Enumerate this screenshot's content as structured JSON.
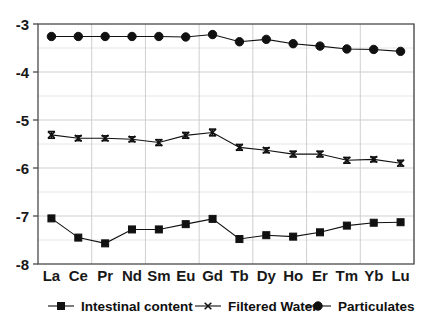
{
  "chart_data": {
    "type": "line",
    "title": "",
    "subtitle": "",
    "xlabel": "",
    "ylabel": "",
    "categories": [
      "La",
      "Ce",
      "Pr",
      "Nd",
      "Sm",
      "Eu",
      "Gd",
      "Tb",
      "Dy",
      "Ho",
      "Er",
      "Tm",
      "Yb",
      "Lu"
    ],
    "ylim": [
      -8,
      -3
    ],
    "yticks": [
      -3,
      -4,
      -5,
      -6,
      -7,
      -8
    ],
    "ytick_labels": [
      "-3",
      "-4",
      "-5",
      "-6",
      "-7",
      "-8"
    ],
    "grid": true,
    "legend_position": "bottom",
    "series": [
      {
        "name": "Intestinal content",
        "marker": "square",
        "color": "#111111",
        "values": [
          -7.05,
          -7.45,
          -7.57,
          -7.28,
          -7.28,
          -7.17,
          -7.06,
          -7.48,
          -7.4,
          -7.43,
          -7.34,
          -7.2,
          -7.14,
          -7.13
        ],
        "errors": [
          0,
          0,
          0,
          0,
          0,
          0,
          0,
          0,
          0,
          0,
          0,
          0,
          0,
          0
        ]
      },
      {
        "name": "Filtered Water",
        "marker": "x-errorbar",
        "color": "#111111",
        "values": [
          -5.31,
          -5.38,
          -5.38,
          -5.4,
          -5.47,
          -5.32,
          -5.26,
          -5.57,
          -5.63,
          -5.71,
          -5.71,
          -5.84,
          -5.82,
          -5.9
        ],
        "errors": [
          0.07,
          0.05,
          0.05,
          0.05,
          0.06,
          0.06,
          0.07,
          0.06,
          0.05,
          0.06,
          0.06,
          0.06,
          0.05,
          0.06
        ]
      },
      {
        "name": "Particulates",
        "marker": "circle",
        "color": "#111111",
        "values": [
          -3.26,
          -3.26,
          -3.26,
          -3.26,
          -3.26,
          -3.27,
          -3.22,
          -3.37,
          -3.32,
          -3.41,
          -3.46,
          -3.52,
          -3.53,
          -3.57
        ],
        "errors": [
          0,
          0,
          0,
          0,
          0,
          0,
          0,
          0,
          0,
          0,
          0,
          0,
          0,
          0
        ]
      }
    ]
  },
  "legend": {
    "items": [
      {
        "label": "Intestinal content",
        "marker": "square"
      },
      {
        "label": "Filtered Water",
        "marker": "x-errorbar"
      },
      {
        "label": "Particulates",
        "marker": "circle"
      }
    ]
  },
  "colors": {
    "axis": "#4a4a4a",
    "grid": "#cfcfcf",
    "series": "#111111",
    "text": "#141414",
    "background": "#ffffff"
  }
}
